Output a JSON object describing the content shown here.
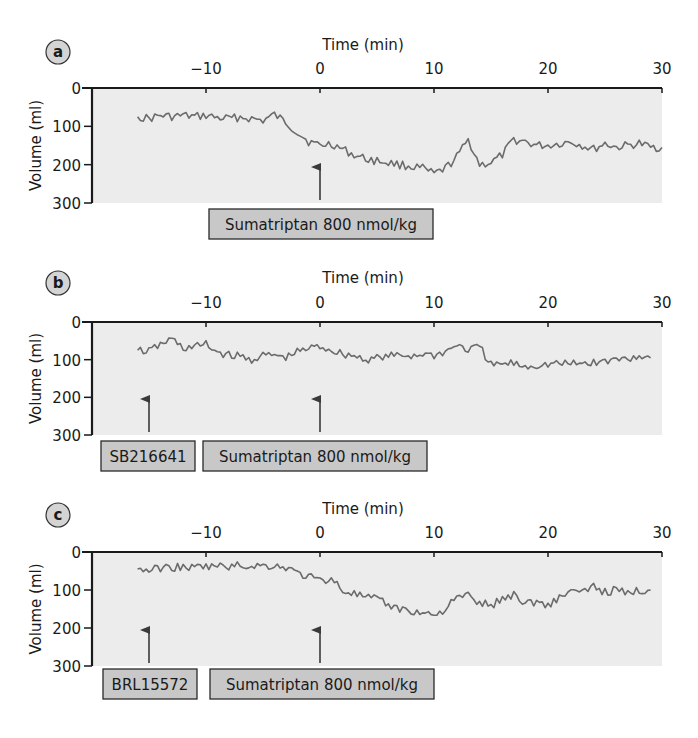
{
  "figure": {
    "panels": [
      {
        "label": "a",
        "x_title": "Time (min)",
        "y_title": "Volume (ml)",
        "x_ticks": [
          "−10",
          "0",
          "10",
          "20",
          "30"
        ],
        "y_ticks": [
          "0",
          "100",
          "200",
          "300"
        ],
        "annotations": [
          {
            "text": "Sumatriptan 800 nmol/kg",
            "arrow_time": 0
          }
        ]
      },
      {
        "label": "b",
        "x_title": "Time (min)",
        "y_title": "Volume (ml)",
        "x_ticks": [
          "−10",
          "0",
          "10",
          "20",
          "30"
        ],
        "y_ticks": [
          "0",
          "100",
          "200",
          "300"
        ],
        "annotations": [
          {
            "text": "SB216641",
            "arrow_time": -15
          },
          {
            "text": "Sumatriptan 800 nmol/kg",
            "arrow_time": 0
          }
        ]
      },
      {
        "label": "c",
        "x_title": "Time (min)",
        "y_title": "Volume (ml)",
        "x_ticks": [
          "−10",
          "0",
          "10",
          "20",
          "30"
        ],
        "y_ticks": [
          "0",
          "100",
          "200",
          "300"
        ],
        "annotations": [
          {
            "text": "BRL15572",
            "arrow_time": -15
          },
          {
            "text": "Sumatriptan 800 nmol/kg",
            "arrow_time": 0
          }
        ]
      }
    ],
    "colors": {
      "plot_bg": "#ececec",
      "trace": "#6b6b6b",
      "box_fill": "#c8c8c8",
      "axis": "#1a1a1a",
      "circle_fill": "#d4d4d4"
    }
  },
  "chart_data": [
    {
      "type": "line",
      "title": "a",
      "xlabel": "Time (min)",
      "ylabel": "Volume (ml)",
      "xlim": [
        -20,
        30
      ],
      "ylim": [
        300,
        0
      ],
      "y_inverted": true,
      "grid": false,
      "annotations": [
        {
          "text": "Sumatriptan 800 nmol/kg",
          "x": 0
        }
      ],
      "x": [
        -16,
        -15,
        -14,
        -13,
        -12,
        -11,
        -10,
        -9,
        -8,
        -7,
        -6,
        -5,
        -4,
        -3,
        -2,
        -1,
        0,
        1,
        2,
        3,
        4,
        5,
        6,
        7,
        8,
        9,
        10,
        11,
        12,
        13,
        14,
        15,
        16,
        17,
        18,
        19,
        20,
        21,
        22,
        23,
        24,
        25,
        26,
        27,
        28,
        29,
        30
      ],
      "values": [
        75,
        80,
        72,
        75,
        72,
        75,
        72,
        78,
        80,
        76,
        80,
        85,
        70,
        90,
        115,
        140,
        150,
        145,
        160,
        175,
        185,
        190,
        195,
        200,
        205,
        210,
        225,
        210,
        180,
        135,
        200,
        195,
        175,
        135,
        140,
        150,
        150,
        145,
        140,
        150,
        160,
        145,
        155,
        150,
        145,
        155,
        155
      ]
    },
    {
      "type": "line",
      "title": "b",
      "xlabel": "Time (min)",
      "ylabel": "Volume (ml)",
      "xlim": [
        -20,
        30
      ],
      "ylim": [
        300,
        0
      ],
      "y_inverted": true,
      "grid": false,
      "annotations": [
        {
          "text": "SB216641",
          "x": -15
        },
        {
          "text": "Sumatriptan 800 nmol/kg",
          "x": 0
        }
      ],
      "x": [
        -16,
        -15,
        -14,
        -13,
        -12,
        -11,
        -10,
        -9,
        -8,
        -7,
        -6,
        -5,
        -4,
        -3,
        -2,
        -1,
        0,
        1,
        2,
        3,
        4,
        5,
        6,
        7,
        8,
        9,
        10,
        11,
        12,
        13,
        14,
        15,
        16,
        17,
        18,
        19,
        20,
        21,
        22,
        23,
        24,
        25,
        26,
        27,
        28,
        29
      ],
      "values": [
        75,
        78,
        60,
        45,
        70,
        65,
        60,
        80,
        88,
        92,
        100,
        90,
        88,
        95,
        80,
        70,
        65,
        75,
        85,
        90,
        100,
        95,
        92,
        88,
        90,
        85,
        88,
        80,
        60,
        75,
        65,
        115,
        112,
        110,
        118,
        115,
        112,
        110,
        112,
        110,
        108,
        105,
        100,
        95,
        90,
        95
      ]
    },
    {
      "type": "line",
      "title": "c",
      "xlabel": "Time (min)",
      "ylabel": "Volume (ml)",
      "xlim": [
        -20,
        30
      ],
      "ylim": [
        300,
        0
      ],
      "y_inverted": true,
      "grid": false,
      "annotations": [
        {
          "text": "BRL15572",
          "x": -15
        },
        {
          "text": "Sumatriptan 800 nmol/kg",
          "x": 0
        }
      ],
      "x": [
        -16,
        -15,
        -14,
        -13,
        -12,
        -11,
        -10,
        -9,
        -8,
        -7,
        -6,
        -5,
        -4,
        -3,
        -2,
        -1,
        0,
        1,
        2,
        3,
        4,
        5,
        6,
        7,
        8,
        9,
        10,
        11,
        12,
        13,
        14,
        15,
        16,
        17,
        18,
        19,
        20,
        21,
        22,
        23,
        24,
        25,
        26,
        27,
        28,
        29
      ],
      "values": [
        45,
        48,
        42,
        40,
        40,
        42,
        38,
        38,
        38,
        36,
        36,
        36,
        36,
        40,
        55,
        65,
        75,
        70,
        100,
        110,
        120,
        125,
        140,
        150,
        155,
        160,
        165,
        150,
        120,
        115,
        135,
        140,
        125,
        110,
        135,
        130,
        140,
        120,
        100,
        110,
        90,
        105,
        100,
        110,
        100,
        100
      ]
    }
  ]
}
